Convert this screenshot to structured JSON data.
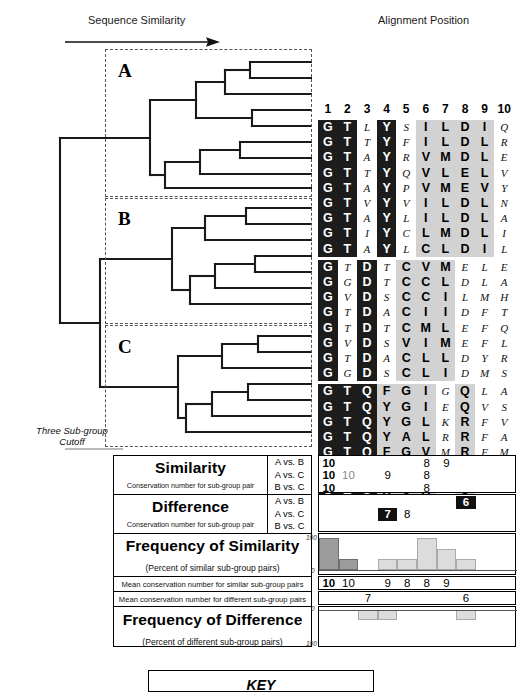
{
  "figure": {
    "sequence_similarity_label": "Sequence Similarity",
    "alignment_position_label": "Alignment Position",
    "cutoff_label": "Three Sub-group\nCutoff",
    "key_label": "KEY"
  },
  "dendrogram": {
    "groups": [
      {
        "name": "A",
        "leaves": 9
      },
      {
        "name": "B",
        "leaves": 8
      },
      {
        "name": "C",
        "leaves": 9
      }
    ]
  },
  "alignment": {
    "column_headers": [
      "1",
      "2",
      "3",
      "4",
      "5",
      "6",
      "7",
      "8",
      "9",
      "10"
    ],
    "groups": [
      {
        "name": "A",
        "column_shading": [
          "dark",
          "dark",
          "lite",
          "dark",
          "lite",
          "mid",
          "mid",
          "mid",
          "mid",
          "lite"
        ],
        "rows": [
          [
            "G",
            "T",
            "L",
            "Y",
            "S",
            "I",
            "L",
            "D",
            "I",
            "Q"
          ],
          [
            "G",
            "T",
            "T",
            "Y",
            "F",
            "I",
            "L",
            "D",
            "L",
            "R"
          ],
          [
            "G",
            "T",
            "A",
            "Y",
            "R",
            "V",
            "M",
            "D",
            "L",
            "E"
          ],
          [
            "G",
            "T",
            "T",
            "Y",
            "Q",
            "V",
            "L",
            "E",
            "L",
            "V"
          ],
          [
            "G",
            "T",
            "A",
            "Y",
            "P",
            "V",
            "M",
            "E",
            "V",
            "Y"
          ],
          [
            "G",
            "T",
            "V",
            "Y",
            "V",
            "I",
            "L",
            "D",
            "L",
            "N"
          ],
          [
            "G",
            "T",
            "A",
            "Y",
            "L",
            "I",
            "L",
            "D",
            "L",
            "A"
          ],
          [
            "G",
            "T",
            "I",
            "Y",
            "C",
            "L",
            "M",
            "D",
            "L",
            "I"
          ],
          [
            "G",
            "T",
            "A",
            "Y",
            "L",
            "C",
            "L",
            "D",
            "I",
            "L"
          ]
        ]
      },
      {
        "name": "B",
        "column_shading": [
          "dark",
          "lite",
          "dark",
          "lite",
          "mid",
          "mid",
          "mid",
          "lite",
          "lite",
          "lite"
        ],
        "rows": [
          [
            "G",
            "T",
            "D",
            "T",
            "C",
            "V",
            "M",
            "E",
            "L",
            "E"
          ],
          [
            "G",
            "G",
            "D",
            "T",
            "C",
            "C",
            "L",
            "D",
            "L",
            "A"
          ],
          [
            "G",
            "V",
            "D",
            "S",
            "C",
            "C",
            "I",
            "L",
            "M",
            "H"
          ],
          [
            "G",
            "T",
            "D",
            "A",
            "C",
            "I",
            "I",
            "D",
            "F",
            "T"
          ],
          [
            "G",
            "T",
            "D",
            "T",
            "C",
            "M",
            "L",
            "E",
            "F",
            "Q"
          ],
          [
            "G",
            "V",
            "D",
            "S",
            "V",
            "I",
            "M",
            "E",
            "F",
            "L"
          ],
          [
            "G",
            "T",
            "D",
            "A",
            "C",
            "L",
            "L",
            "D",
            "Y",
            "R"
          ],
          [
            "G",
            "G",
            "D",
            "S",
            "C",
            "L",
            "I",
            "D",
            "M",
            "S"
          ]
        ]
      },
      {
        "name": "C",
        "column_shading": [
          "dark",
          "dark",
          "dark",
          "mid",
          "mid",
          "mid",
          "lite",
          "mid",
          "lite",
          "lite"
        ],
        "rows": [
          [
            "G",
            "T",
            "Q",
            "F",
            "G",
            "I",
            "G",
            "Q",
            "L",
            "A"
          ],
          [
            "G",
            "T",
            "Q",
            "Y",
            "G",
            "I",
            "E",
            "Q",
            "V",
            "S"
          ],
          [
            "G",
            "T",
            "Q",
            "Y",
            "G",
            "L",
            "K",
            "R",
            "F",
            "V"
          ],
          [
            "G",
            "T",
            "Q",
            "Y",
            "A",
            "L",
            "R",
            "R",
            "F",
            "A"
          ],
          [
            "G",
            "T",
            "Q",
            "F",
            "G",
            "V",
            "M",
            "R",
            "F",
            "M"
          ],
          [
            "G",
            "T",
            "Q",
            "Y",
            "G",
            "L",
            "L",
            "Q",
            "Y",
            "L"
          ],
          [
            "G",
            "T",
            "Q",
            "Y",
            "G",
            "L",
            "Q",
            "Q",
            "M",
            "S"
          ],
          [
            "G",
            "T",
            "Q",
            "Y",
            "C",
            "V",
            "E",
            "Q",
            "V",
            "I"
          ],
          [
            "G",
            "T",
            "Q",
            "Y",
            "A",
            "L",
            "K",
            "R",
            "L",
            ""
          ]
        ]
      }
    ]
  },
  "panels": {
    "similarity": {
      "title": "Similarity",
      "subtitle": "Conservation number for sub-group pair",
      "pairs": [
        "A vs. B",
        "A vs. C",
        "B vs. C"
      ],
      "rows": [
        [
          {
            "col": 1,
            "value": "10",
            "style": "bold"
          },
          {
            "col": 6,
            "value": "8",
            "style": "plain"
          },
          {
            "col": 7,
            "value": "9",
            "style": "plain"
          }
        ],
        [
          {
            "col": 1,
            "value": "10",
            "style": "bold"
          },
          {
            "col": 2,
            "value": "10",
            "style": "gray"
          },
          {
            "col": 4,
            "value": "9",
            "style": "plain"
          },
          {
            "col": 6,
            "value": "8",
            "style": "plain"
          }
        ],
        [
          {
            "col": 1,
            "value": "10",
            "style": "bold"
          },
          {
            "col": 6,
            "value": "8",
            "style": "plain"
          }
        ]
      ]
    },
    "difference": {
      "title": "Difference",
      "subtitle": "Conservation number for sub-group pair",
      "pairs": [
        "A vs. B",
        "A vs. C",
        "B vs. C"
      ],
      "rows": [
        [
          {
            "col": 8,
            "value": "6",
            "style": "inverse"
          }
        ],
        [
          {
            "col": 4,
            "value": "7",
            "style": "inverse"
          },
          {
            "col": 5,
            "value": "8",
            "style": "plain"
          }
        ],
        []
      ]
    },
    "freq_similarity": {
      "title": "Frequency of Similarity",
      "subtitle": "(Percent of similar sub-group pairs)",
      "axis_top": "100",
      "axis_bottom": "0"
    },
    "mean_similar": {
      "label": "Mean conservation number for similar sub-group pairs",
      "values": [
        {
          "col": 1,
          "value": "10",
          "style": "bold"
        },
        {
          "col": 2,
          "value": "10",
          "style": "plain"
        },
        {
          "col": 4,
          "value": "9",
          "style": "plain"
        },
        {
          "col": 5,
          "value": "8",
          "style": "plain"
        },
        {
          "col": 6,
          "value": "8",
          "style": "plain"
        },
        {
          "col": 7,
          "value": "9",
          "style": "plain"
        }
      ]
    },
    "mean_different": {
      "label": "Mean conservation number for different sub-group pairs",
      "values": [
        {
          "col": 3,
          "value": "7",
          "style": "plain"
        },
        {
          "col": 8,
          "value": "6",
          "style": "plain"
        }
      ]
    },
    "freq_difference": {
      "title": "Frequency of Difference",
      "subtitle": "(Percent of different sub-group pairs)",
      "axis_top": "0",
      "axis_bottom": "100"
    }
  },
  "chart_data": [
    {
      "type": "bar",
      "title": "Frequency of Similarity",
      "ylabel": "Percent of similar sub-group pairs",
      "xlabel": "Alignment Position",
      "categories": [
        "1",
        "2",
        "3",
        "4",
        "5",
        "6",
        "7",
        "8",
        "9",
        "10"
      ],
      "values": [
        100,
        33,
        0,
        33,
        33,
        100,
        67,
        33,
        0,
        0
      ],
      "ylim": [
        0,
        100
      ],
      "grid": false,
      "legend": "none",
      "series": [
        {
          "name": "fully conserved",
          "values": [
            100,
            33,
            0,
            0,
            0,
            0,
            0,
            0,
            0,
            0
          ],
          "color": "#9c9c9c"
        },
        {
          "name": "partially conserved",
          "values": [
            0,
            0,
            0,
            33,
            33,
            100,
            67,
            33,
            0,
            0
          ],
          "color": "#dcdcdc"
        }
      ]
    },
    {
      "type": "bar",
      "title": "Frequency of Difference",
      "ylabel": "Percent of different sub-group pairs",
      "xlabel": "Alignment Position",
      "categories": [
        "1",
        "2",
        "3",
        "4",
        "5",
        "6",
        "7",
        "8",
        "9",
        "10"
      ],
      "values": [
        0,
        0,
        33,
        33,
        0,
        0,
        0,
        33,
        0,
        0
      ],
      "ylim": [
        0,
        100
      ],
      "grid": false,
      "legend": "none",
      "direction": "down"
    }
  ]
}
